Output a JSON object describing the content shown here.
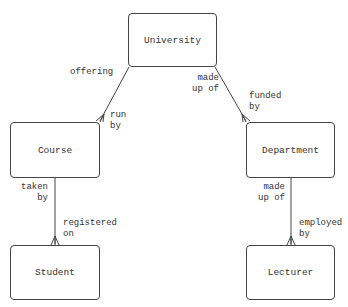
{
  "header": {
    "cut_text": "Data"
  },
  "entities": {
    "university": "University",
    "course": "Course",
    "department": "Department",
    "student": "Student",
    "lecturer": "Lecturer"
  },
  "relationships": [
    {
      "from": "University",
      "to": "Course",
      "from_label": "offering",
      "to_label": "run\nby",
      "cardinality": "one-to-many"
    },
    {
      "from": "University",
      "to": "Department",
      "from_label": "made\nup of",
      "to_label": "funded\nby",
      "cardinality": "one-to-many"
    },
    {
      "from": "Course",
      "to": "Student",
      "from_label": "taken\nby",
      "to_label": "registered\non",
      "cardinality": "one-to-many"
    },
    {
      "from": "Department",
      "to": "Lecturer",
      "from_label": "made\nup of",
      "to_label": "employed\nby",
      "cardinality": "one-to-many"
    }
  ]
}
